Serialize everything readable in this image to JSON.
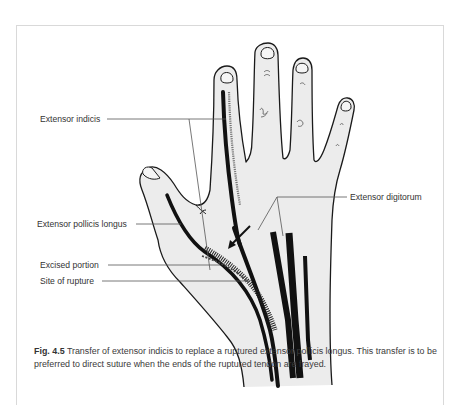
{
  "figure": {
    "labels": {
      "extensor_indicis": "Extensor indicis",
      "extensor_digitorum": "Extensor digitorum",
      "extensor_pollicis_longus": "Extensor pollicis longus",
      "excised_portion": "Excised portion",
      "site_of_rupture": "Site of rupture"
    },
    "caption": {
      "number": "Fig. 4.5",
      "text": "Transfer of extensor indicis to replace a ruptured extensor pollicis longus. This transfer is to be preferred to direct suture when the ends of the ruptured tendon are frayed."
    },
    "colors": {
      "skin": "#ececec",
      "outline": "#1a1a1a",
      "tendon": "#111111",
      "leader_line": "#555555",
      "frame": "#d9d9d9"
    }
  }
}
